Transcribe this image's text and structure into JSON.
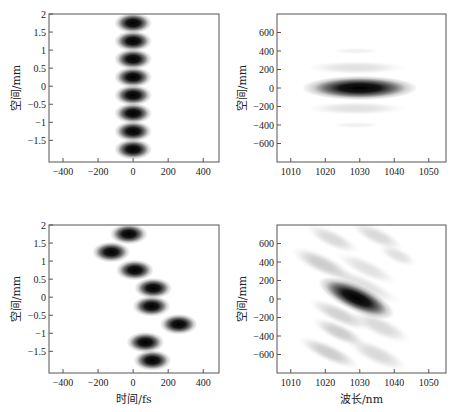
{
  "chart_data": [
    {
      "type": "heatmap",
      "title": "",
      "xlabel": "",
      "ylabel": "空间/mm",
      "xlim": [
        -480,
        490
      ],
      "ylim": [
        -2.1,
        2
      ],
      "xticks": [
        -400,
        -200,
        0,
        200,
        400
      ],
      "xtick_labels": [
        "−400",
        "−200",
        "0",
        "200",
        "400"
      ],
      "yticks": [
        2,
        1.5,
        1,
        0.5,
        0,
        -0.5,
        -1,
        -1.5
      ],
      "ytick_labels": [
        "2",
        "1.5",
        "1",
        "0.5",
        "0",
        "−0.5",
        "−1",
        "−1.5"
      ],
      "colormap": "gray (white = 0, black = max)",
      "blobs": [
        {
          "x": 0,
          "y": 1.75,
          "intensity": 1.0
        },
        {
          "x": 0,
          "y": 1.25,
          "intensity": 1.0
        },
        {
          "x": 0,
          "y": 0.75,
          "intensity": 1.0
        },
        {
          "x": 0,
          "y": 0.25,
          "intensity": 1.0
        },
        {
          "x": 0,
          "y": -0.25,
          "intensity": 1.0
        },
        {
          "x": 0,
          "y": -0.75,
          "intensity": 1.0
        },
        {
          "x": 0,
          "y": -1.25,
          "intensity": 1.0
        },
        {
          "x": 0,
          "y": -1.75,
          "intensity": 1.0
        }
      ],
      "blob_sigma": {
        "x": 45,
        "y": 0.12
      }
    },
    {
      "type": "heatmap",
      "title": "",
      "xlabel": "",
      "ylabel": "空间/mm",
      "xlim": [
        1006,
        1055
      ],
      "ylim": [
        -800,
        800
      ],
      "xticks": [
        1010,
        1020,
        1030,
        1040,
        1050
      ],
      "xtick_labels": [
        "1010",
        "1020",
        "1030",
        "1040",
        "1050"
      ],
      "yticks": [
        600,
        400,
        200,
        0,
        -200,
        -400,
        -600
      ],
      "ytick_labels": [
        "600",
        "400",
        "200",
        "0",
        "−200",
        "−400",
        "−600"
      ],
      "colormap": "gray (white = 0, black = max)",
      "blobs": [
        {
          "x": 1030,
          "y": 0,
          "intensity": 1.0,
          "sx": 7,
          "sy": 55
        },
        {
          "x": 1029,
          "y": 220,
          "intensity": 0.12,
          "sx": 6,
          "sy": 30
        },
        {
          "x": 1029,
          "y": -220,
          "intensity": 0.12,
          "sx": 6,
          "sy": 30
        },
        {
          "x": 1029,
          "y": 400,
          "intensity": 0.06,
          "sx": 3,
          "sy": 15
        },
        {
          "x": 1029,
          "y": -400,
          "intensity": 0.06,
          "sx": 3,
          "sy": 15
        }
      ]
    },
    {
      "type": "heatmap",
      "title": "",
      "xlabel": "时间/fs",
      "ylabel": "空间/mm",
      "xlim": [
        -480,
        490
      ],
      "ylim": [
        -2.1,
        2
      ],
      "xticks": [
        -400,
        -200,
        0,
        200,
        400
      ],
      "xtick_labels": [
        "−400",
        "−200",
        "0",
        "200",
        "400"
      ],
      "yticks": [
        2,
        1.5,
        1,
        0.5,
        0,
        -0.5,
        -1,
        -1.5
      ],
      "ytick_labels": [
        "2",
        "1.5",
        "1",
        "0.5",
        "0",
        "−0.5",
        "−1",
        "−1.5"
      ],
      "colormap": "gray (white = 0, black = max)",
      "blobs": [
        {
          "x": -25,
          "y": 1.75,
          "intensity": 1.0
        },
        {
          "x": -125,
          "y": 1.25,
          "intensity": 1.0
        },
        {
          "x": 10,
          "y": 0.75,
          "intensity": 1.0
        },
        {
          "x": 115,
          "y": 0.25,
          "intensity": 1.0
        },
        {
          "x": 105,
          "y": -0.25,
          "intensity": 1.0
        },
        {
          "x": 260,
          "y": -0.75,
          "intensity": 1.0
        },
        {
          "x": 70,
          "y": -1.25,
          "intensity": 1.0
        },
        {
          "x": 110,
          "y": -1.75,
          "intensity": 1.0
        }
      ],
      "blob_sigma": {
        "x": 45,
        "y": 0.12
      }
    },
    {
      "type": "heatmap",
      "title": "",
      "xlabel": "波长/nm",
      "ylabel": "空间/mm",
      "xlim": [
        1006,
        1055
      ],
      "ylim": [
        -800,
        800
      ],
      "xticks": [
        1010,
        1020,
        1030,
        1040,
        1050
      ],
      "xtick_labels": [
        "1010",
        "1020",
        "1030",
        "1040",
        "1050"
      ],
      "yticks": [
        600,
        400,
        200,
        0,
        -200,
        -400,
        -600
      ],
      "ytick_labels": [
        "600",
        "400",
        "200",
        "0",
        "−200",
        "−400",
        "−600"
      ],
      "colormap": "gray (white = 0, black = max)",
      "tilt_deg": -25,
      "blobs": [
        {
          "x": 1029,
          "y": 10,
          "intensity": 1.0,
          "sx": 5,
          "sy": 60
        },
        {
          "x": 1022,
          "y": 650,
          "intensity": 0.15,
          "sx": 3.5,
          "sy": 40
        },
        {
          "x": 1035,
          "y": 680,
          "intensity": 0.15,
          "sx": 3.5,
          "sy": 40
        },
        {
          "x": 1019,
          "y": 380,
          "intensity": 0.2,
          "sx": 4,
          "sy": 45
        },
        {
          "x": 1032,
          "y": 330,
          "intensity": 0.12,
          "sx": 4,
          "sy": 40
        },
        {
          "x": 1041,
          "y": 470,
          "intensity": 0.12,
          "sx": 2.5,
          "sy": 35
        },
        {
          "x": 1031,
          "y": 150,
          "intensity": 0.12,
          "sx": 5,
          "sy": 40
        },
        {
          "x": 1024,
          "y": -170,
          "intensity": 0.18,
          "sx": 4,
          "sy": 40
        },
        {
          "x": 1036,
          "y": -300,
          "intensity": 0.15,
          "sx": 4,
          "sy": 45
        },
        {
          "x": 1024,
          "y": -360,
          "intensity": 0.2,
          "sx": 3.5,
          "sy": 40
        },
        {
          "x": 1021,
          "y": -580,
          "intensity": 0.2,
          "sx": 4,
          "sy": 40
        },
        {
          "x": 1035,
          "y": -600,
          "intensity": 0.15,
          "sx": 4,
          "sy": 45
        }
      ]
    }
  ]
}
